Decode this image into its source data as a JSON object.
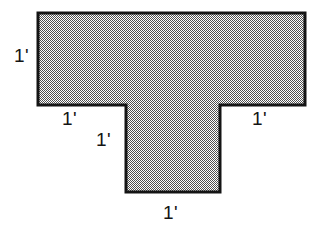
{
  "figure": {
    "kind": "geometry-diagram",
    "shape_name": "t-shape-polygon",
    "stroke_color": "#141414",
    "fill_color": "#a8a8a8",
    "background_color": "#ffffff",
    "stroke_width": 3,
    "fill_pattern": "dither-checkerboard-50",
    "vertices": [
      [
        38,
        13
      ],
      [
        305,
        13
      ],
      [
        305,
        105
      ],
      [
        220,
        105
      ],
      [
        220,
        192
      ],
      [
        126,
        192
      ],
      [
        126,
        105
      ],
      [
        38,
        105
      ]
    ],
    "labels": [
      {
        "id": "left-height",
        "text": "1'",
        "x": 14,
        "y": 46,
        "edge": "left-vertical"
      },
      {
        "id": "top-bar-bottom-left",
        "text": "1'",
        "x": 62,
        "y": 109,
        "edge": "bottom-of-top-bar-left"
      },
      {
        "id": "stem-left",
        "text": "1'",
        "x": 96,
        "y": 130,
        "edge": "stem-left-vertical"
      },
      {
        "id": "top-bar-bottom-right",
        "text": "1'",
        "x": 252,
        "y": 109,
        "edge": "bottom-of-top-bar-right"
      },
      {
        "id": "stem-bottom",
        "text": "1'",
        "x": 163,
        "y": 203,
        "edge": "stem-bottom-horizontal"
      }
    ]
  }
}
